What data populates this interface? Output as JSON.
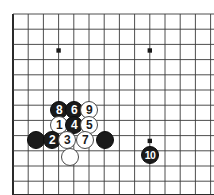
{
  "diagram": {
    "type": "go-board",
    "board_style": "corner-view",
    "grid": {
      "origin_x": 13,
      "origin_y": 14,
      "spacing": 15.2,
      "cols": 14,
      "rows": 12,
      "line_color": "#3a3a3a",
      "edge_color": "#2a2a2a",
      "background": "#ffffff"
    },
    "star_points": [
      {
        "col": 3,
        "row": 2.4
      },
      {
        "col": 9,
        "row": 2.4
      },
      {
        "col": 9,
        "row": 8.35
      }
    ],
    "stone_radius": 9.2,
    "stones": [
      {
        "label": "8",
        "color": "black",
        "x": 59,
        "y": 110
      },
      {
        "label": "6",
        "color": "black",
        "x": 74,
        "y": 110
      },
      {
        "label": "9",
        "color": "white",
        "x": 89,
        "y": 110
      },
      {
        "label": "1",
        "color": "white",
        "x": 59,
        "y": 125
      },
      {
        "label": "4",
        "color": "black",
        "x": 74,
        "y": 125
      },
      {
        "label": "5",
        "color": "white",
        "x": 89,
        "y": 125
      },
      {
        "label": "",
        "color": "black",
        "x": 36,
        "y": 140
      },
      {
        "label": "2",
        "color": "black",
        "x": 52,
        "y": 140
      },
      {
        "label": "3",
        "color": "white",
        "x": 67,
        "y": 140
      },
      {
        "label": "7",
        "color": "white",
        "x": 85,
        "y": 140
      },
      {
        "label": "",
        "color": "black",
        "x": 105,
        "y": 140
      },
      {
        "label": "",
        "color": "white",
        "x": 70,
        "y": 157
      },
      {
        "label": "10",
        "color": "black",
        "x": 150,
        "y": 155
      }
    ],
    "move_sequence": [
      {
        "move": 1,
        "color": "white"
      },
      {
        "move": 2,
        "color": "black"
      },
      {
        "move": 3,
        "color": "white"
      },
      {
        "move": 4,
        "color": "black"
      },
      {
        "move": 5,
        "color": "white"
      },
      {
        "move": 6,
        "color": "black"
      },
      {
        "move": 7,
        "color": "white"
      },
      {
        "move": 8,
        "color": "black"
      },
      {
        "move": 9,
        "color": "white"
      },
      {
        "move": 10,
        "color": "black"
      }
    ]
  }
}
